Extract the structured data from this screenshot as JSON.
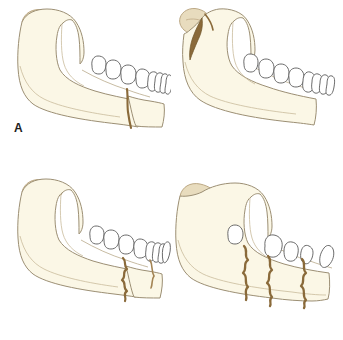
{
  "figure": {
    "panel_count": 4,
    "background_color": "#ffffff"
  },
  "colors": {
    "bone_fill": "#fbf7e6",
    "bone_outline": "#9c8f74",
    "cartilage_cap": "#e8dcbe",
    "cartilage_outline": "#b5a07a",
    "fracture_line": "#8a6a3a",
    "fracture_line_dark": "#6d5326",
    "tooth_fill": "#ffffff",
    "tooth_outline": "#5a5a5a",
    "label_text": "#1d1d1d"
  },
  "panels": [
    {
      "id": "a",
      "label": "A",
      "caption": "Simple fracture of the mandibular body",
      "fracture_type": "simple",
      "fracture_count": 1,
      "fracture_site": "anterior body / parasymphysis",
      "displacement": "none",
      "condyle_intact": true,
      "teeth_count": 8
    },
    {
      "id": "b",
      "label": "B",
      "caption": "Displaced fracture of the mandibular condyle",
      "fracture_type": "condylar",
      "fracture_count": 1,
      "fracture_site": "condylar neck / subcondylar",
      "displacement": "displaced condylar head",
      "condyle_intact": false,
      "teeth_count": 8
    },
    {
      "id": "c",
      "label": "C",
      "caption": "Comminuted fracture of the mandibular body",
      "fracture_type": "comminuted",
      "fracture_count": 1,
      "fracture_site": "body, jagged margin",
      "displacement": "none",
      "condyle_intact": true,
      "teeth_count": 8
    },
    {
      "id": "d",
      "label": "D",
      "caption": "Multiple comminuted fractures with displaced fragments",
      "fracture_type": "multiple-comminuted",
      "fracture_count": 3,
      "fracture_site": "body and parasymphysis, multiple fragments",
      "displacement": "displaced fragments with tilted teeth",
      "condyle_intact": true,
      "teeth_count": 5
    }
  ]
}
